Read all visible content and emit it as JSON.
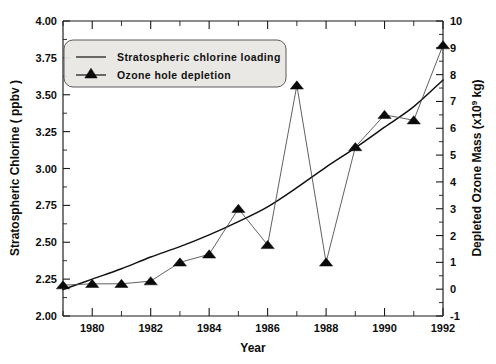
{
  "chart_data": {
    "type": "line",
    "title": "",
    "xlabel": "Year",
    "ylabel": "Stratospheric Chlorine ( ppbv )",
    "y2label": "Depleted Ozone Mass (x10⁹ kg)",
    "xlim": [
      1979,
      1992
    ],
    "ylim": [
      2.0,
      4.0
    ],
    "y2lim": [
      -1,
      10
    ],
    "grid": false,
    "legend_position": "top-left",
    "x": [
      1979,
      1980,
      1981,
      1982,
      1983,
      1984,
      1985,
      1986,
      1987,
      1988,
      1989,
      1990,
      1991,
      1992
    ],
    "xticks": [
      1980,
      1982,
      1984,
      1986,
      1988,
      1990,
      1992
    ],
    "xticklabels": [
      "1980",
      "1982",
      "1984",
      "1986",
      "1988",
      "1990",
      "1992"
    ],
    "xticks_minor": [
      1979,
      1981,
      1983,
      1985,
      1987,
      1989,
      1991
    ],
    "yticks": [
      2.0,
      2.25,
      2.5,
      2.75,
      3.0,
      3.25,
      3.5,
      3.75,
      4.0
    ],
    "yticklabels": [
      "2.00",
      "2.25",
      "2.50",
      "2.75",
      "3.00",
      "3.25",
      "3.50",
      "3.75",
      "4.00"
    ],
    "y2ticks": [
      -1,
      0,
      1,
      2,
      3,
      4,
      5,
      6,
      7,
      8,
      9,
      10
    ],
    "y2ticklabels": [
      "-1",
      "0",
      "1",
      "2",
      "3",
      "4",
      "5",
      "6",
      "7",
      "8",
      "9",
      "10"
    ],
    "series": [
      {
        "name": "Stratospheric chlorine loading",
        "axis": "left",
        "marker": "none",
        "color": "#111111",
        "values": [
          2.18,
          2.25,
          2.32,
          2.4,
          2.47,
          2.55,
          2.64,
          2.74,
          2.87,
          3.01,
          3.14,
          3.28,
          3.42,
          3.6
        ]
      },
      {
        "name": "Ozone hole depletion",
        "axis": "right",
        "marker": "triangle",
        "color": "#0a0a0a",
        "values": [
          0.15,
          0.2,
          0.2,
          0.3,
          1.0,
          1.3,
          3.0,
          1.65,
          7.6,
          1.0,
          5.3,
          6.5,
          6.3,
          9.1
        ]
      }
    ],
    "legend": [
      {
        "label": "Stratospheric chlorine loading",
        "marker": "line"
      },
      {
        "label": "Ozone hole depletion",
        "marker": "triangle-line"
      }
    ]
  },
  "axes": {
    "x_title": "Year",
    "y_left_title": "Stratospheric Chlorine ( ppbv )",
    "y_right_title_main": "Depleted Ozone Mass (x10",
    "y_right_title_exp": "9",
    "y_right_title_tail": " kg)"
  }
}
